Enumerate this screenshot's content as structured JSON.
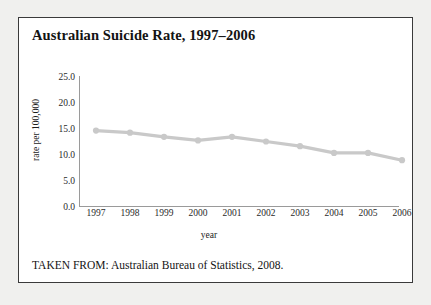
{
  "figure": {
    "title": "Australian Suicide Rate, 1997–2006",
    "caption": "TAKEN FROM: Australian Bureau of Statistics, 2008.",
    "border_color": "#3a3a3a",
    "background_color": "#ffffff",
    "page_background": "#f0f0ee"
  },
  "chart_data": {
    "type": "line",
    "title": "Australian Suicide Rate, 1997–2006",
    "xlabel": "year",
    "ylabel": "rate per 100,000",
    "categories": [
      "1997",
      "1998",
      "1999",
      "2000",
      "2001",
      "2002",
      "2003",
      "2004",
      "2005",
      "2006"
    ],
    "values": [
      14.7,
      14.3,
      13.5,
      12.8,
      13.5,
      12.6,
      11.7,
      10.4,
      10.4,
      9.0
    ],
    "series": [
      {
        "name": "Australian suicide rate",
        "values": [
          14.7,
          14.3,
          13.5,
          12.8,
          13.5,
          12.6,
          11.7,
          10.4,
          10.4,
          9.0
        ],
        "color": "#c9c9c9",
        "marker": "circle"
      }
    ],
    "ylim": [
      0.0,
      25.0
    ],
    "yticks": [
      "0.0",
      "5.0",
      "10.0",
      "15.0",
      "20.0",
      "25.0"
    ],
    "ytick_values": [
      0.0,
      5.0,
      10.0,
      15.0,
      20.0,
      25.0
    ],
    "xticks": [
      "1997",
      "1998",
      "1999",
      "2000",
      "2001",
      "2002",
      "2003",
      "2004",
      "2005",
      "2006"
    ],
    "grid": false,
    "legend": null,
    "line_color": "#c9c9c9",
    "axis_color": "#9a9a9a"
  }
}
